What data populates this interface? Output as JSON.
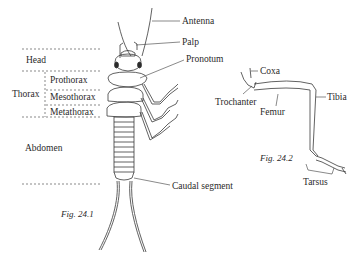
{
  "figure1": {
    "caption": "Fig. 24.1",
    "labels": {
      "antenna": "Antenna",
      "palp": "Palp",
      "pronotum": "Pronotum",
      "caudal_segment": "Caudal segment"
    },
    "regions": {
      "head": "Head",
      "thorax": "Thorax",
      "prothorax": "Prothorax",
      "mesothorax": "Mesothorax",
      "metathorax": "Metathorax",
      "abdomen": "Abdomen"
    }
  },
  "figure2": {
    "caption": "Fig. 24.2",
    "labels": {
      "coxa": "Coxa",
      "trochanter": "Trochanter",
      "femur": "Femur",
      "tibia": "Tibia",
      "tarsus": "Tarsus"
    }
  },
  "colors": {
    "line": "#3a3a3a",
    "text": "#2a2a2a",
    "background": "#ffffff"
  }
}
